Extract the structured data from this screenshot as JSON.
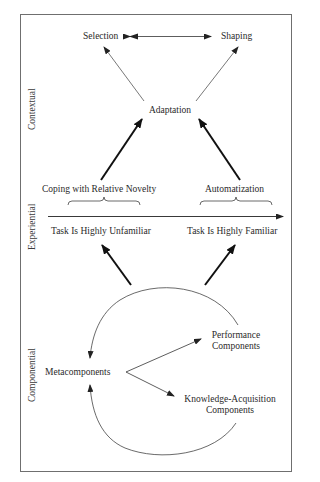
{
  "sections": {
    "contextual": "Contextual",
    "experiential": "Experiential",
    "componential": "Componential"
  },
  "contextual": {
    "selection": "Selection",
    "shaping": "Shaping",
    "adaptation": "Adaptation"
  },
  "experiential": {
    "coping": "Coping with Relative Novelty",
    "automatization": "Automatization",
    "unfamiliar": "Task Is Highly Unfamiliar",
    "familiar": "Task Is Highly Familiar"
  },
  "componential": {
    "metacomponents": "Metacomponents",
    "performance_line1": "Performance",
    "performance_line2": "Components",
    "knowledge_line1": "Knowledge-Acquisition",
    "knowledge_line2": "Components"
  },
  "colors": {
    "frame": "#6f6f6f",
    "thin_arrow": "#555555",
    "thick_arrow": "#111111",
    "text": "#2a2a2a"
  }
}
